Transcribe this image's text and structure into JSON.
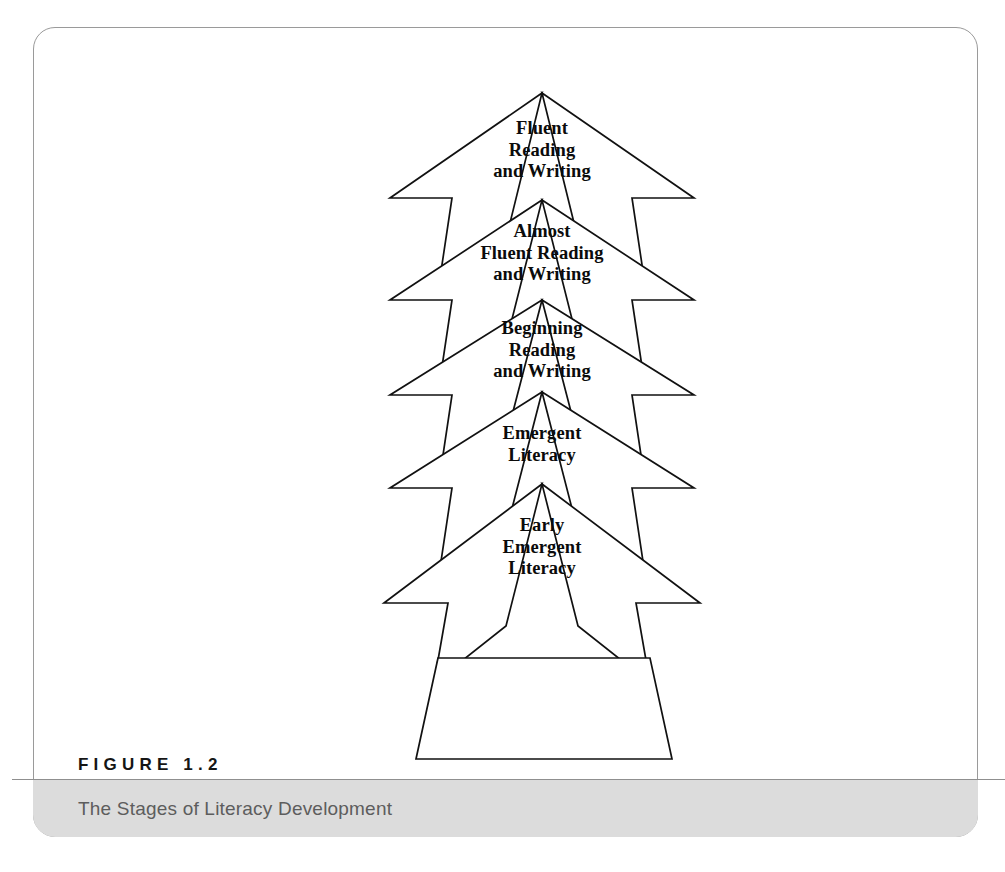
{
  "figure": {
    "number_label": "FIGURE 1.2",
    "title": "The Stages of Literacy Development"
  },
  "diagram": {
    "type": "pyramid-tree",
    "orientation": "bottom-to-top",
    "stroke_color": "#111111",
    "fill_color": "#ffffff",
    "panel_border_color": "#9a9a9a",
    "caption_band_color": "#dcdcdc",
    "tiers": [
      {
        "index": 1,
        "label": "Fluent\nReading\nand  Writing"
      },
      {
        "index": 2,
        "label": "Almost\nFluent  Reading\nand  Writing"
      },
      {
        "index": 3,
        "label": "Beginning\nReading\nand  Writing"
      },
      {
        "index": 4,
        "label": "Emergent\nLiteracy"
      },
      {
        "index": 5,
        "label": "Early\nEmergent\nLiteracy"
      }
    ]
  }
}
